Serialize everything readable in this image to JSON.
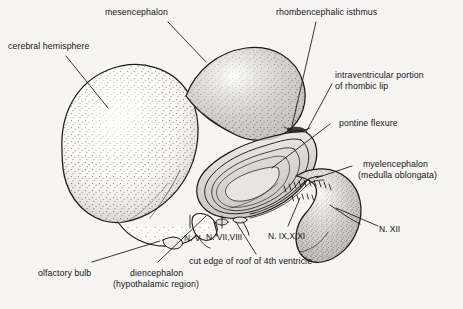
{
  "figure": {
    "kind": "anatomical-illustration",
    "background_color": "#f4f2ee",
    "ink_color": "#1a1a1a",
    "width": 463,
    "height": 309
  },
  "labels": {
    "mesencephalon": "mesencephalon",
    "cerebral_hemisphere": "cerebral hemisphere",
    "rhombencephalic_isthmus": "rhombencephalic isthmus",
    "intraventricular_line1": "intraventricular portion",
    "intraventricular_line2": "of rhombic lip",
    "pontine_flexure": "pontine flexure",
    "myelencephalon_line1": "myelencephalon",
    "myelencephalon_line2": "(medulla oblongata)",
    "olfactory_bulb": "olfactory bulb",
    "diencephalon_line1": "diencephalon",
    "diencephalon_line2": "(hypothalamic region)",
    "cut_edge": "cut edge of roof of 4th ventricle",
    "nerve_v": "N. V",
    "nerve_vii_viii": "N. VII,VIII",
    "nerve_ix_x_xi": "N. IX,X,XI",
    "nerve_xii": "N. XII"
  }
}
